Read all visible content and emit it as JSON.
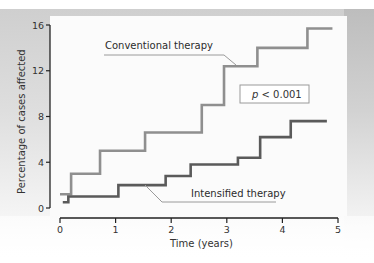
{
  "chart_data": {
    "type": "line",
    "subtype": "step",
    "title": "",
    "xlabel": "Time (years)",
    "ylabel": "Percentage of cases affected",
    "xlim": [
      0,
      5
    ],
    "ylim": [
      0,
      16
    ],
    "xticks": [
      0,
      1,
      2,
      3,
      4,
      5
    ],
    "yticks": [
      0,
      4,
      8,
      12,
      16
    ],
    "grid": false,
    "legend": "inline callouts",
    "annotation": {
      "text_italic": "p",
      "text_rest": " < 0.001",
      "full": "p < 0.001"
    },
    "series": [
      {
        "name": "Conventional therapy",
        "color": "#8a8a8a",
        "x": [
          0,
          0.2,
          0.72,
          1.53,
          2.55,
          2.95,
          3.55,
          4.45,
          4.9
        ],
        "y": [
          1.2,
          3.0,
          5.0,
          6.6,
          9.0,
          12.4,
          14.0,
          15.7,
          15.7
        ]
      },
      {
        "name": "Intensified therapy",
        "color": "#555555",
        "x": [
          0.05,
          0.15,
          1.05,
          1.9,
          2.35,
          3.2,
          3.6,
          4.15,
          4.8
        ],
        "y": [
          0.5,
          1.0,
          2.0,
          2.8,
          3.8,
          4.4,
          6.2,
          7.6,
          7.6
        ]
      }
    ]
  },
  "labels": {
    "ylabel": "Percentage of cases affected",
    "xlabel": "Time (years)",
    "conventional": "Conventional therapy",
    "intensified": "Intensified therapy",
    "p_italic": "p",
    "p_rest": " < 0.001",
    "yticks": [
      "0",
      "4",
      "8",
      "12",
      "16"
    ],
    "xticks": [
      "0",
      "1",
      "2",
      "3",
      "4",
      "5"
    ]
  },
  "colors": {
    "conventional": "#8f8f8f",
    "intensified": "#5a5a5a",
    "axis": "#222222",
    "callout_line": "#9a9a9a",
    "pbox_border": "#9a9a9a"
  }
}
